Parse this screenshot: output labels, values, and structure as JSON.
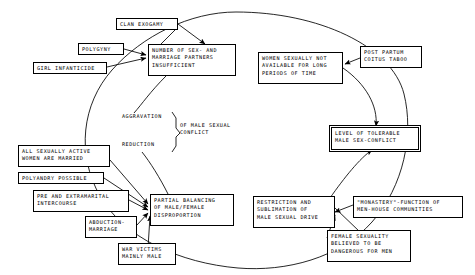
{
  "diagram": {
    "type": "causal-loop",
    "stroke_color": "#000000",
    "background_color": "#ffffff",
    "nodes": [
      {
        "id": "clan_exogamy",
        "label": "CLAN EXOGAMY",
        "x": 116,
        "y": 18,
        "w": 62,
        "h": 12,
        "style": "box"
      },
      {
        "id": "polygyny",
        "label": "POLYGYNY",
        "x": 78,
        "y": 43,
        "w": 46,
        "h": 12,
        "style": "box"
      },
      {
        "id": "girl_infanticide",
        "label": "GIRL INFANTICIDE",
        "x": 33,
        "y": 62,
        "w": 74,
        "h": 12,
        "style": "box"
      },
      {
        "id": "number_partners",
        "label": "NUMBER OF SEX- AND\nMARRIAGE PARTNERS\nINSUFFICIENT",
        "x": 148,
        "y": 44,
        "w": 88,
        "h": 32,
        "style": "box"
      },
      {
        "id": "women_unavailable",
        "label": "WOMEN SEXUALLY NOT\nAVAILABLE FOR LONG\nPERIODS OF TIME",
        "x": 258,
        "y": 52,
        "w": 85,
        "h": 32,
        "style": "box"
      },
      {
        "id": "post_partum",
        "label": "POST PARTUM\nCOITUS TABOO",
        "x": 360,
        "y": 46,
        "w": 62,
        "h": 22,
        "style": "box"
      },
      {
        "id": "level_tolerable",
        "label": "LEVEL OF TOLERABLE\nMALE SEX-CONFLICT",
        "x": 331,
        "y": 127,
        "w": 88,
        "h": 23,
        "style": "double"
      },
      {
        "id": "of_male_sexual",
        "label": "OF MALE SEXUAL\nCONFLICT",
        "x": 176,
        "y": 122,
        "w": 72,
        "h": 22,
        "style": "plain"
      },
      {
        "id": "aggravation",
        "label": "AGGRAVATION",
        "x": 122,
        "y": 113,
        "w": 60,
        "h": 11,
        "style": "plain"
      },
      {
        "id": "reduction",
        "label": "REDUCTION",
        "x": 122,
        "y": 141,
        "w": 52,
        "h": 11,
        "style": "plain"
      },
      {
        "id": "all_married",
        "label": "ALL SEXUALLY ACTIVE\nWOMEN ARE MARRIED",
        "x": 18,
        "y": 145,
        "w": 92,
        "h": 22,
        "style": "box"
      },
      {
        "id": "polyandry",
        "label": "POLYANDRY POSSIBLE",
        "x": 18,
        "y": 172,
        "w": 86,
        "h": 12,
        "style": "box"
      },
      {
        "id": "pre_extramarital",
        "label": "PRE AND EXTRAMARITAL\nINTERCOURSE",
        "x": 33,
        "y": 190,
        "w": 96,
        "h": 22,
        "style": "box"
      },
      {
        "id": "abduction",
        "label": "ABDUCTION-\nMARRIAGE",
        "x": 85,
        "y": 216,
        "w": 52,
        "h": 22,
        "style": "box"
      },
      {
        "id": "war_victims",
        "label": "WAR VICTIMS\nMAINLY MALE",
        "x": 118,
        "y": 243,
        "w": 58,
        "h": 22,
        "style": "box"
      },
      {
        "id": "partial_balancing",
        "label": "PARTIAL BALANCING\nOF MALE/FEMALE\nDISPROPORTION",
        "x": 150,
        "y": 194,
        "w": 84,
        "h": 32,
        "style": "box"
      },
      {
        "id": "restriction",
        "label": "RESTRICTION AND\nSUBLIMATION OF\nMALE SEXUAL DRIVE",
        "x": 253,
        "y": 196,
        "w": 82,
        "h": 32,
        "style": "box"
      },
      {
        "id": "monastery",
        "label": "\"MONASTERY\"-FUNCTION OF\nMEN-HOUSE COMMUNITIES",
        "x": 353,
        "y": 196,
        "w": 110,
        "h": 22,
        "style": "box"
      },
      {
        "id": "female_dangerous",
        "label": "FEMALE SEXUALITY\nBELIEVED TO BE\nDANGEROUS FOR MEN",
        "x": 327,
        "y": 230,
        "w": 84,
        "h": 32,
        "style": "box"
      }
    ],
    "edges": [
      {
        "from": "clan_exogamy",
        "to": "number_partners",
        "arrow": true
      },
      {
        "from": "polygyny",
        "to": "number_partners",
        "arrow": true
      },
      {
        "from": "girl_infanticide",
        "to": "number_partners",
        "arrow": true
      },
      {
        "from": "post_partum",
        "to": "women_unavailable",
        "arrow": true
      },
      {
        "from": "women_unavailable",
        "to": "level_tolerable",
        "arrow": true
      },
      {
        "from": "number_partners",
        "to": "level_tolerable",
        "arrow": true
      },
      {
        "from": "all_married",
        "to": "partial_balancing",
        "arrow": true
      },
      {
        "from": "polyandry",
        "to": "partial_balancing",
        "arrow": true
      },
      {
        "from": "pre_extramarital",
        "to": "partial_balancing",
        "arrow": true
      },
      {
        "from": "abduction",
        "to": "partial_balancing",
        "arrow": true
      },
      {
        "from": "war_victims",
        "to": "partial_balancing",
        "arrow": true
      },
      {
        "from": "monastery",
        "to": "restriction",
        "arrow": true
      },
      {
        "from": "female_dangerous",
        "to": "restriction",
        "arrow": true
      },
      {
        "from": "restriction",
        "to": "level_tolerable",
        "arrow": true
      },
      {
        "from": "partial_balancing",
        "to": "aggravation",
        "arrow": true
      }
    ],
    "cycle_label": "main feedback loop ellipse"
  }
}
